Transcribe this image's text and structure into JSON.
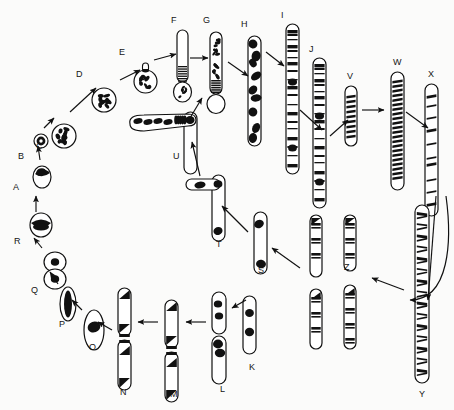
{
  "figure": {
    "kind": "biological-diagram",
    "background_color": "#fbfbfa",
    "ink_color": "#111111",
    "width": 454,
    "height": 410
  },
  "stages": [
    {
      "id": "A",
      "label": "A",
      "label_x": 13,
      "label_y": 183,
      "shape_x": 33,
      "shape_y": 166,
      "type": "oval-nucleus-dark-cap"
    },
    {
      "id": "B",
      "label": "B",
      "label_x": 18,
      "label_y": 152,
      "shape_x": 34,
      "shape_y": 134,
      "type": "small-ringed-nucleus"
    },
    {
      "id": "C",
      "label": "C",
      "label_x": 36,
      "label_y": 142,
      "shape_x": 52,
      "shape_y": 124,
      "type": "speckled-circle-nucleus"
    },
    {
      "id": "D",
      "label": "D",
      "label_x": 76,
      "label_y": 70,
      "shape_x": 92,
      "shape_y": 88,
      "type": "speckled-circle-nucleus"
    },
    {
      "id": "E",
      "label": "E",
      "label_x": 119,
      "label_y": 48,
      "shape_x": 134,
      "shape_y": 66,
      "type": "speckled-circle-with-bud"
    },
    {
      "id": "F",
      "label": "F",
      "label_x": 171,
      "label_y": 16,
      "shape_x": 177,
      "shape_y": 30,
      "type": "rod-with-basal-bulb"
    },
    {
      "id": "G",
      "label": "G",
      "label_x": 203,
      "label_y": 16,
      "shape_x": 210,
      "shape_y": 32,
      "type": "speckled-rod-with-bulb"
    },
    {
      "id": "H",
      "label": "H",
      "label_x": 241,
      "label_y": 20,
      "shape_x": 248,
      "shape_y": 36,
      "type": "blotched-chromosome"
    },
    {
      "id": "I",
      "label": "I",
      "label_x": 281,
      "label_y": 11,
      "shape_x": 286,
      "shape_y": 24,
      "type": "banded-chromosome"
    },
    {
      "id": "J",
      "label": "J",
      "label_x": 309,
      "label_y": 45,
      "shape_x": 313,
      "shape_y": 58,
      "type": "banded-chromosome"
    },
    {
      "id": "K",
      "label": "K",
      "label_x": 249,
      "label_y": 363,
      "shape_x": 243,
      "shape_y": 296,
      "type": "rod-two-blobs"
    },
    {
      "id": "L",
      "label": "L",
      "label_x": 220,
      "label_y": 385,
      "shape_x": 212,
      "shape_y": 292,
      "type": "paired-rod-blobs"
    },
    {
      "id": "M",
      "label": "M",
      "label_x": 170,
      "label_y": 390,
      "shape_x": 165,
      "shape_y": 300,
      "type": "paired-rod-dark-ends"
    },
    {
      "id": "N",
      "label": "N",
      "label_x": 120,
      "label_y": 388,
      "shape_x": 118,
      "shape_y": 288,
      "type": "paired-rod-dark-ends"
    },
    {
      "id": "O",
      "label": "O",
      "label_x": 89,
      "label_y": 343,
      "shape_x": 84,
      "shape_y": 310,
      "type": "rod-single-blob"
    },
    {
      "id": "P",
      "label": "P",
      "label_x": 59,
      "label_y": 320,
      "shape_x": 60,
      "shape_y": 287,
      "type": "elongated-dark-oval"
    },
    {
      "id": "Q",
      "label": "Q",
      "label_x": 31,
      "label_y": 286,
      "shape_x": 44,
      "shape_y": 252,
      "type": "figure-eight-nucleus"
    },
    {
      "id": "R",
      "label": "R",
      "label_x": 14,
      "label_y": 237,
      "shape_x": 30,
      "shape_y": 213,
      "type": "oval-nucleus-dark-band"
    },
    {
      "id": "S",
      "label": "S",
      "label_x": 258,
      "label_y": 266,
      "shape_x": 254,
      "shape_y": 212,
      "type": "rod-blob-top-bottom"
    },
    {
      "id": "T",
      "label": "T",
      "label_x": 216,
      "label_y": 240,
      "shape_x": 196,
      "shape_y": 175,
      "type": "t-shaped-chromosome"
    },
    {
      "id": "U",
      "label": "U",
      "label_x": 173,
      "label_y": 152,
      "shape_x": 132,
      "shape_y": 112,
      "type": "t-shaped-chromosome-long-arm"
    },
    {
      "id": "V",
      "label": "V",
      "label_x": 347,
      "label_y": 72,
      "shape_x": 345,
      "shape_y": 86,
      "type": "short-banded-chromosome"
    },
    {
      "id": "W",
      "label": "W",
      "label_x": 393,
      "label_y": 58,
      "shape_x": 391,
      "shape_y": 72,
      "type": "dense-banded-chromosome"
    },
    {
      "id": "X",
      "label": "X",
      "label_x": 428,
      "label_y": 70,
      "shape_x": 425,
      "shape_y": 84,
      "type": "sparse-banded-chromosome"
    },
    {
      "id": "Y",
      "label": "Y",
      "label_x": 419,
      "label_y": 390,
      "shape_x": 415,
      "shape_y": 205,
      "type": "long-fine-banded-chromosome"
    },
    {
      "id": "Z",
      "label": "Z",
      "label_x": 344,
      "label_y": 263,
      "shape_x": 310,
      "shape_y": 215,
      "type": "banded-chromosome-quartet"
    }
  ],
  "arrows": [
    {
      "from": "A",
      "to": "B"
    },
    {
      "from": "B",
      "to": "C"
    },
    {
      "from": "C",
      "to": "D"
    },
    {
      "from": "D",
      "to": "E"
    },
    {
      "from": "E",
      "to": "F"
    },
    {
      "from": "F",
      "to": "G"
    },
    {
      "from": "G",
      "to": "H"
    },
    {
      "from": "H",
      "to": "I"
    },
    {
      "from": "I",
      "to": "J"
    },
    {
      "from": "J",
      "to": "V"
    },
    {
      "from": "V",
      "to": "W"
    },
    {
      "from": "W",
      "to": "X"
    },
    {
      "from": "X",
      "to": "Y"
    },
    {
      "from": "Y",
      "to": "Z"
    },
    {
      "from": "Z",
      "to": "S"
    },
    {
      "from": "S",
      "to": "T"
    },
    {
      "from": "T",
      "to": "U"
    },
    {
      "from": "U",
      "to": "G"
    },
    {
      "from": "K",
      "to": "L"
    },
    {
      "from": "L",
      "to": "M"
    },
    {
      "from": "M",
      "to": "N"
    },
    {
      "from": "N",
      "to": "O"
    },
    {
      "from": "O",
      "to": "P"
    },
    {
      "from": "P",
      "to": "Q"
    },
    {
      "from": "Q",
      "to": "R"
    },
    {
      "from": "R",
      "to": "A"
    }
  ]
}
